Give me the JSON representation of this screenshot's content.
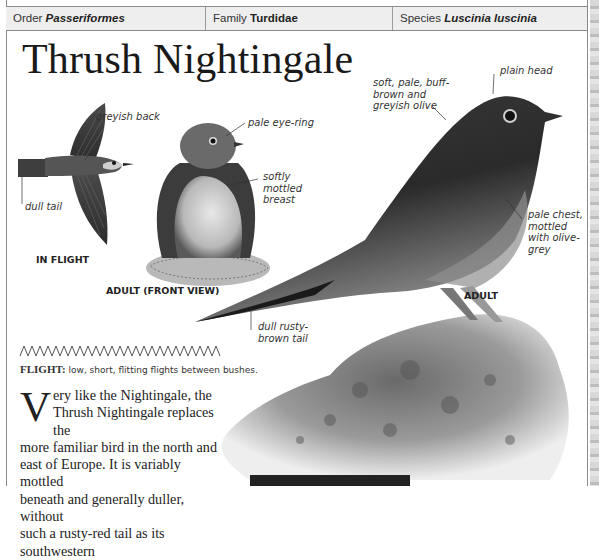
{
  "header": {
    "order": {
      "label": "Order",
      "value": "Passeriformes"
    },
    "family": {
      "label": "Family",
      "value": "Turdidae"
    },
    "species": {
      "label": "Species",
      "value": "Luscinia luscinia"
    }
  },
  "title": "Thrush Nightingale",
  "illustrations": {
    "in_flight": {
      "caption": "IN FLIGHT",
      "labels": {
        "back": "greyish back",
        "tail": "dull tail"
      }
    },
    "front_view": {
      "caption": "ADULT (FRONT VIEW)",
      "labels": {
        "eye": "pale eye-ring",
        "breast": "softly mottled breast"
      }
    },
    "adult": {
      "caption": "ADULT",
      "labels": {
        "upperparts": "soft, pale, buff-brown and greyish olive",
        "head": "plain head",
        "chest": "pale chest, mottled with olive-grey",
        "tail": "dull rusty-brown tail"
      }
    }
  },
  "flight": {
    "icon": "zigzag-flight-pattern-icon",
    "heading": "FLIGHT:",
    "text": "low, short, flitting flights between bushes."
  },
  "description": {
    "dropcap": "V",
    "lines": [
      "ery like the Nightingale, the",
      "Thrush Nightingale replaces the",
      "more familiar bird in the north and",
      "east of Europe. It is variably mottled",
      "beneath and generally duller, without",
      "such a rusty-red tail as its southwestern"
    ]
  },
  "colors": {
    "header_bg": "#eeeeee",
    "border": "#8a8a8a",
    "text": "#222222"
  }
}
